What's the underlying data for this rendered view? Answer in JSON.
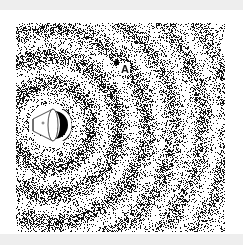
{
  "figure": {
    "point": {
      "label": "A",
      "x": 100,
      "y": 39
    },
    "source": {
      "type": "speaker-icon",
      "x": 34,
      "y": 102
    },
    "rings": [
      28,
      55,
      82,
      110,
      138,
      166,
      194
    ],
    "colors": {
      "ink": "#111111",
      "background": "#ffffff",
      "frame": "#eeeeee"
    }
  }
}
